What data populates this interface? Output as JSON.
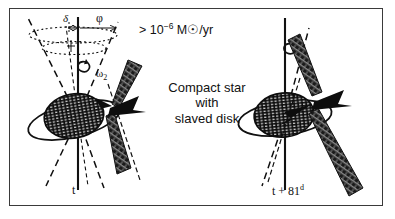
{
  "figure": {
    "background": "#ffffff",
    "ink": "#111111",
    "frame_color": "#3a3a3a"
  },
  "annotations": {
    "mass_loss_prefix": "> 10",
    "mass_loss_exponent": "−6",
    "mass_loss_unit": " M",
    "mass_loss_sun": "☉",
    "mass_loss_suffix": "/yr",
    "caption_line1": "Compact star",
    "caption_line2": "with",
    "caption_line3": "slaved disk",
    "angle_delta": "δ",
    "angle_phi": "φ",
    "omega_symbol": "ω",
    "omega_subscript": "2"
  },
  "panels": [
    {
      "name": "left-panel",
      "time_label": "t",
      "time_superscript": ""
    },
    {
      "name": "right-panel",
      "time_label": "t + 81",
      "time_superscript": "d"
    }
  ]
}
